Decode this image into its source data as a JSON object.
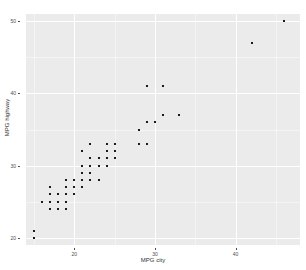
{
  "chart_data": {
    "type": "scatter",
    "title": "",
    "xlabel": "MPG city",
    "ylabel": "MPG highway",
    "xlim": [
      14,
      48
    ],
    "ylim": [
      19,
      51
    ],
    "xticks": [
      20,
      30,
      40
    ],
    "yticks": [
      20,
      30,
      40,
      50
    ],
    "xtick_labels": [
      "20",
      "30",
      "40"
    ],
    "ytick_labels": [
      "20",
      "30",
      "40",
      "50"
    ],
    "grid": true,
    "legend": "none",
    "panel_background": "#ebebeb",
    "grid_color": "#ffffff",
    "point_color": "#1a1a1a",
    "n_points": 93,
    "x": [
      25,
      18,
      20,
      19,
      22,
      22,
      19,
      16,
      19,
      16,
      16,
      25,
      25,
      19,
      21,
      18,
      15,
      17,
      17,
      23,
      21,
      18,
      29,
      23,
      22,
      17,
      21,
      18,
      29,
      20,
      31,
      23,
      22,
      22,
      24,
      15,
      21,
      18,
      17,
      18,
      23,
      19,
      24,
      23,
      18,
      19,
      23,
      31,
      23,
      19,
      19,
      19,
      28,
      18,
      17,
      20,
      19,
      23,
      31,
      23,
      22,
      22,
      24,
      25,
      19,
      30,
      33,
      25,
      18,
      24,
      28,
      46,
      30,
      24,
      42,
      24,
      21,
      18,
      29,
      20,
      17,
      18,
      20,
      19,
      22,
      18,
      25,
      21,
      18,
      21,
      18,
      21,
      20
    ],
    "y": [
      31,
      25,
      26,
      26,
      30,
      31,
      28,
      25,
      27,
      25,
      25,
      33,
      32,
      28,
      29,
      24,
      21,
      26,
      27,
      31,
      32,
      26,
      41,
      30,
      33,
      25,
      28,
      24,
      36,
      26,
      41,
      28,
      29,
      31,
      33,
      20,
      27,
      25,
      24,
      25,
      30,
      24,
      31,
      30,
      26,
      26,
      30,
      37,
      28,
      26,
      26,
      25,
      35,
      24,
      25,
      28,
      25,
      30,
      37,
      28,
      28,
      28,
      32,
      33,
      26,
      36,
      37,
      33,
      24,
      31,
      33,
      50,
      36,
      30,
      47,
      31,
      28,
      24,
      33,
      26,
      25,
      26,
      27,
      26,
      30,
      26,
      33,
      28,
      24,
      29,
      25,
      30,
      28
    ]
  },
  "figure": {
    "axis_label_color": "#333333",
    "tick_label_color": "#4d4d4d"
  }
}
